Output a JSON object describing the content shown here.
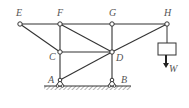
{
  "figure": {
    "type": "truss-diagram",
    "caption": "",
    "colors": {
      "member": "#333333",
      "label": "#555555",
      "ground_hatch": "#666666",
      "background": "#ffffff"
    },
    "nodes": [
      {
        "id": "E",
        "label": "E",
        "x": 20,
        "y": 24,
        "lx": 16,
        "ly": 16
      },
      {
        "id": "F",
        "label": "F",
        "x": 60,
        "y": 24,
        "lx": 57,
        "ly": 16
      },
      {
        "id": "G",
        "label": "G",
        "x": 112,
        "y": 24,
        "lx": 109,
        "ly": 16
      },
      {
        "id": "H",
        "label": "H",
        "x": 167,
        "y": 24,
        "lx": 164,
        "ly": 16
      },
      {
        "id": "C",
        "label": "C",
        "x": 60,
        "y": 52,
        "lx": 49,
        "ly": 60
      },
      {
        "id": "D",
        "label": "D",
        "x": 112,
        "y": 52,
        "lx": 116,
        "ly": 61
      },
      {
        "id": "A",
        "label": "A",
        "x": 60,
        "y": 80,
        "lx": 48,
        "ly": 83
      },
      {
        "id": "B",
        "label": "B",
        "x": 112,
        "y": 80,
        "lx": 121,
        "ly": 83
      }
    ],
    "members": [
      [
        "E",
        "F"
      ],
      [
        "F",
        "G"
      ],
      [
        "G",
        "H"
      ],
      [
        "E",
        "C"
      ],
      [
        "F",
        "C"
      ],
      [
        "F",
        "D"
      ],
      [
        "C",
        "D"
      ],
      [
        "G",
        "D"
      ],
      [
        "H",
        "D"
      ],
      [
        "C",
        "A"
      ],
      [
        "D",
        "B"
      ],
      [
        "A",
        "D"
      ]
    ],
    "supports": [
      {
        "node": "A",
        "type": "pin"
      },
      {
        "node": "B",
        "type": "pin"
      }
    ],
    "load": {
      "node": "H",
      "label": "W",
      "box": {
        "x": 158,
        "y": 43,
        "w": 18,
        "h": 12
      },
      "arrow_end_y": 68
    }
  }
}
